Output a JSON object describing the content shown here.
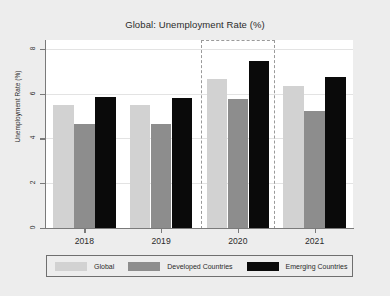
{
  "chart_data": {
    "type": "bar",
    "title": "Global: Unemployment Rate (%)",
    "xlabel": "",
    "ylabel": "Unemployment Rate (%)",
    "categories": [
      "2018",
      "2019",
      "2020",
      "2021"
    ],
    "series": [
      {
        "name": "Global",
        "color": "#d2d2d2",
        "values": [
          5.5,
          5.5,
          6.65,
          6.35
        ]
      },
      {
        "name": "Developed Countries",
        "color": "#8d8d8d",
        "values": [
          4.65,
          4.65,
          5.75,
          5.25
        ]
      },
      {
        "name": "Emerging Countries",
        "color": "#0a0a0a",
        "values": [
          5.85,
          5.8,
          7.45,
          6.75
        ]
      }
    ],
    "ylim": [
      0,
      8.4
    ],
    "yticks": [
      0,
      2,
      4,
      6,
      8
    ],
    "ytick_labels": [
      "0",
      "2",
      "4",
      "6",
      "8"
    ],
    "grid": true,
    "legend_position": "bottom",
    "annotations": [
      {
        "kind": "highlight-box",
        "category": "2020",
        "style": "dashed"
      }
    ]
  },
  "colors": {
    "figure_background": "#ededed",
    "plot_background": "#ffffff",
    "axis": "#7a7a7a",
    "gridline": "#e3e3e3",
    "text": "#2b2b2b",
    "highlight_border": "#9a9a9a"
  }
}
